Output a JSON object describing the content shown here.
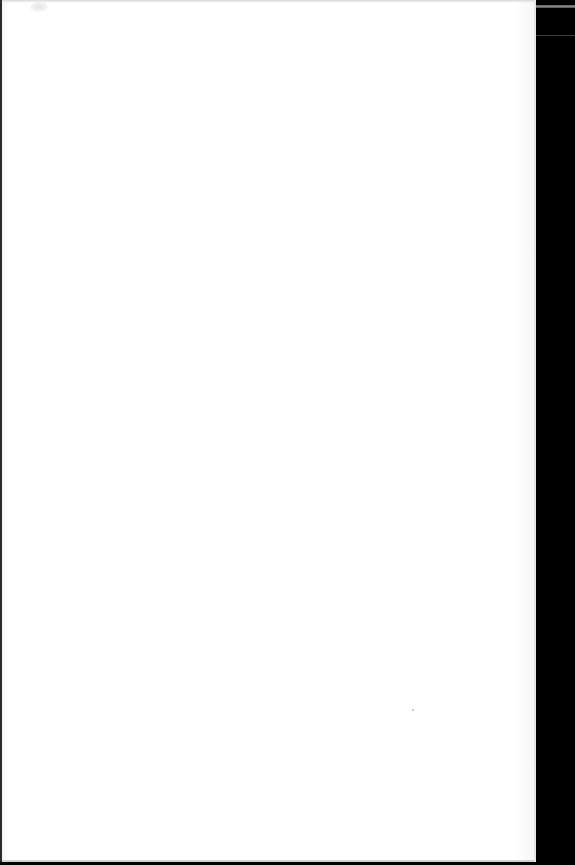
{
  "document": {
    "title": "",
    "body_text": "",
    "state": "blank page"
  },
  "colors": {
    "page": "#ffffff",
    "backdrop": "#000000",
    "page_border": "#2a2a2a",
    "backdrop_line": "#8a8a8a"
  }
}
